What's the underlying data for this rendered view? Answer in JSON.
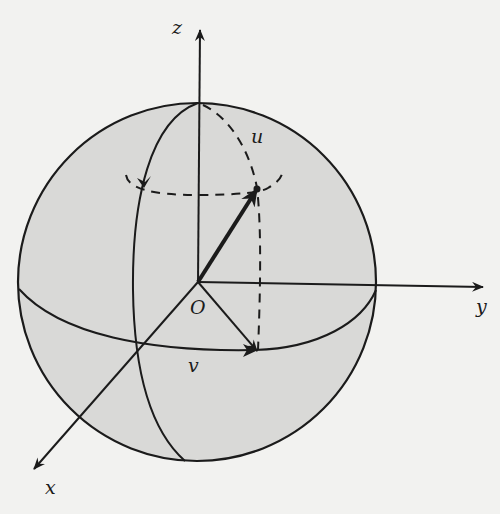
{
  "figure": {
    "colors": {
      "background": "#f2f2f0",
      "sphere_fill": "#d9d9d7",
      "stroke": "#1b1b1b"
    },
    "labels": {
      "z_axis": "z",
      "y_axis": "y",
      "x_axis": "x",
      "origin": "O",
      "vector_u": "u",
      "vector_v": "v"
    },
    "elements": [
      "sphere-outline",
      "equator-front-solid",
      "meridian-front-solid",
      "meridian-dashed-through-u",
      "latitude-circle-dashed",
      "vector-u-bold-arrow",
      "vector-v-arrow",
      "dashed-projection-u-to-v",
      "rotation-arrow-on-latitude"
    ]
  }
}
